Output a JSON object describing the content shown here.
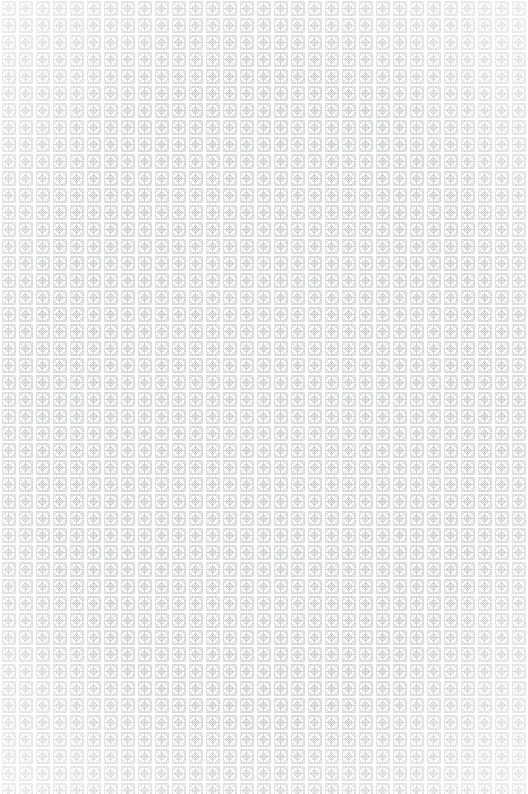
{
  "image": {
    "kind": "ornamental-pattern-texture",
    "description": "Seamless repeating ornamental lattice pattern of square framed tiles each containing a four-petal diamond rosette, printed in pale gray on an off-white ground",
    "width": 528,
    "height": 794,
    "surface": "faded printed wallpaper / textile swatch",
    "orientation": "portrait",
    "bleed": "full-bleed, pattern runs to all four edges with no margin"
  },
  "pattern": {
    "motif_name": "framed diamond rosette",
    "tile_width": 17,
    "tile_height": 17,
    "columns": 31,
    "rows": 47,
    "repeat": "grid / block repeat",
    "frame_shape": "square outline with stippled dotted edges",
    "center_shape": "four-pointed diamond rosette with radiating petals",
    "gutter_vertical": "bright white channel, approx 2px",
    "gutter_horizontal": "bright white channel, approx 1px",
    "symmetry": "four-fold, both axes mirrored"
  },
  "palette": {
    "background": "#fcfcfc",
    "paper": "#fdfdfd",
    "gutter": "#ffffff",
    "motif_light": "#dcdfe1",
    "motif_mid": "#c8ccce",
    "motif_dark": "#b4b8bc",
    "frame_stroke": "#cfd2d5",
    "rosette_core": "#bcc0c4",
    "edge_wash": "#ffffff"
  },
  "rendering": {
    "tile_px": 17,
    "tile_count_x": 31,
    "tile_count_y": 47,
    "frame_inset": 2,
    "rosette_radius": 4,
    "mottle_opacity": 0.5,
    "edge_wash_opacity": 0.62,
    "global_fade": 0.18
  }
}
